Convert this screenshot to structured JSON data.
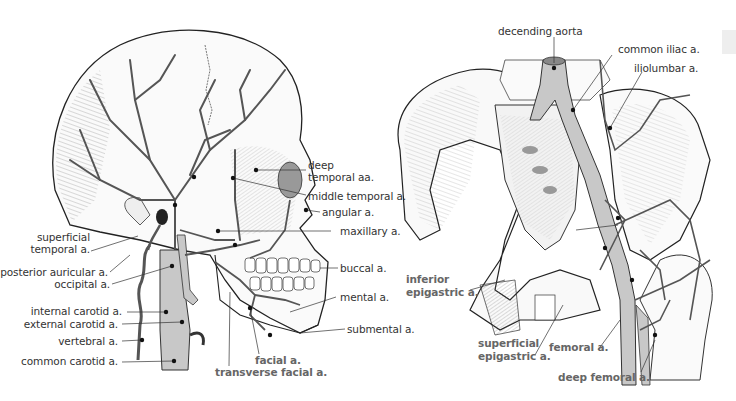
{
  "figure": {
    "colors": {
      "vessel_fill": "#c8c8c8",
      "line": "#333333",
      "label_regular": "#333333",
      "label_bold": "#666666",
      "background": "#ffffff"
    },
    "left_panel": {
      "subject": "head-and-neck-arteries",
      "labels": {
        "deep_temporal_1": "deep",
        "deep_temporal_2": "temporal aa.",
        "middle_temporal": "middle temporal a.",
        "angular": "angular a.",
        "maxillary": "maxillary a.",
        "superficial_temporal_1": "superficial",
        "superficial_temporal_2": "temporal a.",
        "posterior_auricular": "posterior auricular a.",
        "occipital": "occipital a.",
        "buccal": "buccal a.",
        "internal_carotid": "internal carotid a.",
        "external_carotid": "external carotid a.",
        "mental": "mental a.",
        "vertebral": "vertebral a.",
        "submental": "submental a.",
        "common_carotid": "common carotid a.",
        "facial": "facial a.",
        "transverse_facial": "transverse facial a."
      }
    },
    "right_panel": {
      "subject": "pelvic-and-femoral-arteries",
      "labels": {
        "descending_aorta": "decending aorta",
        "common_iliac": "common iliac a.",
        "iliolumbar": "iliolumbar a.",
        "inferior_epigastric_1": "inferior",
        "inferior_epigastric_2": "epigastric a.",
        "superficial_epigastric_1": "superficial",
        "superficial_epigastric_2": "epigastric a.",
        "femoral": "femoral a.",
        "deep_femoral": "deep femoral a."
      }
    }
  }
}
